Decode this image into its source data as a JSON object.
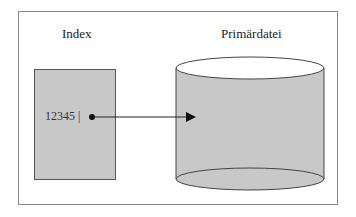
{
  "diagram": {
    "index_label": "Index",
    "primary_label": "Primärdatei",
    "index_entry": "12345 |",
    "colors": {
      "fill_gray": "#c8c8c8",
      "stroke": "#444444",
      "frame": "#8a8a8a",
      "top_ellipse": "#ffffff"
    }
  }
}
